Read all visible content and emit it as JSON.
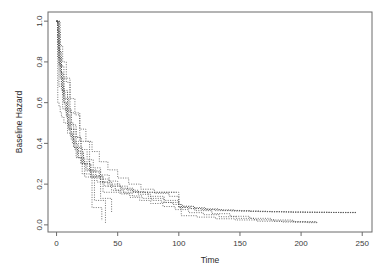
{
  "figure": {
    "background_color": "#ffffff",
    "plot_box": {
      "left_px": 48,
      "right_px": 372,
      "top_px": 12,
      "bottom_px": 232,
      "frame_color": "#6b6b6b"
    }
  },
  "chart_data": {
    "type": "line",
    "title": "",
    "subtitle": "",
    "xlabel": "Time",
    "ylabel": "Baseline Hazard",
    "xlim": [
      -7,
      258
    ],
    "ylim": [
      -0.035,
      1.045
    ],
    "xticks": [
      0,
      50,
      100,
      150,
      200,
      250
    ],
    "xticklabels": [
      "0",
      "50",
      "100",
      "150",
      "200",
      "250"
    ],
    "yticks": [
      0.0,
      0.2,
      0.4,
      0.6,
      0.8,
      1.0
    ],
    "yticklabels": [
      "0.0",
      "0.2",
      "0.4",
      "0.6",
      "0.8",
      "1.0"
    ],
    "grid": false,
    "legend": null,
    "legend_position": "none",
    "annotations": [],
    "line_style": "dotted",
    "line_color": "#4d4d4d",
    "step_type": "post",
    "series": [
      {
        "name": "curve-1",
        "x": [
          0,
          1,
          2,
          3,
          4,
          5,
          6,
          8,
          10,
          12,
          15,
          18,
          21,
          25,
          30,
          36,
          42,
          48,
          55,
          62,
          70,
          78,
          86,
          95,
          103,
          112,
          122,
          133,
          145,
          158,
          172,
          188,
          205,
          222,
          245
        ],
        "y": [
          1.0,
          0.93,
          0.86,
          0.79,
          0.72,
          0.66,
          0.6,
          0.53,
          0.47,
          0.42,
          0.37,
          0.33,
          0.3,
          0.27,
          0.24,
          0.21,
          0.19,
          0.17,
          0.155,
          0.142,
          0.13,
          0.12,
          0.11,
          0.1,
          0.092,
          0.085,
          0.079,
          0.074,
          0.07,
          0.067,
          0.065,
          0.063,
          0.062,
          0.061,
          0.06
        ]
      },
      {
        "name": "curve-2",
        "x": [
          0,
          1,
          2,
          3,
          5,
          7,
          9,
          11,
          14,
          17,
          20,
          24,
          28,
          33,
          39,
          45,
          52,
          60,
          68,
          77,
          87,
          97,
          108,
          120,
          133,
          147,
          162,
          178,
          195,
          213
        ],
        "y": [
          1.0,
          0.9,
          0.82,
          0.75,
          0.64,
          0.56,
          0.49,
          0.44,
          0.38,
          0.33,
          0.3,
          0.265,
          0.235,
          0.21,
          0.19,
          0.17,
          0.152,
          0.135,
          0.12,
          0.105,
          0.09,
          0.075,
          0.06,
          0.05,
          0.04,
          0.032,
          0.025,
          0.018,
          0.014,
          0.01
        ]
      },
      {
        "name": "curve-3",
        "x": [
          0,
          1,
          2,
          4,
          6,
          8,
          11,
          14,
          18,
          22,
          27,
          32,
          38,
          45,
          53,
          62,
          72,
          83,
          95,
          100,
          108,
          118,
          130,
          143,
          158,
          175,
          193,
          212,
          232,
          245
        ],
        "y": [
          1.0,
          0.88,
          0.79,
          0.68,
          0.6,
          0.54,
          0.47,
          0.41,
          0.36,
          0.31,
          0.27,
          0.24,
          0.21,
          0.19,
          0.175,
          0.163,
          0.16,
          0.16,
          0.16,
          0.085,
          0.08,
          0.075,
          0.07,
          0.068,
          0.066,
          0.064,
          0.062,
          0.061,
          0.06,
          0.06
        ]
      },
      {
        "name": "curve-4",
        "x": [
          0,
          2,
          4,
          6,
          9,
          12,
          16,
          20,
          25,
          30,
          36,
          43,
          50,
          58,
          67,
          77,
          88,
          100,
          113,
          127,
          142,
          158,
          175,
          193,
          212
        ],
        "y": [
          1.0,
          0.85,
          0.74,
          0.65,
          0.56,
          0.49,
          0.43,
          0.37,
          0.32,
          0.28,
          0.245,
          0.215,
          0.19,
          0.17,
          0.15,
          0.13,
          0.11,
          0.09,
          0.07,
          0.055,
          0.042,
          0.032,
          0.024,
          0.016,
          0.01
        ]
      },
      {
        "name": "curve-5-step",
        "x": [
          0,
          3,
          7,
          11,
          11,
          19,
          19,
          27,
          27,
          36,
          36,
          45,
          45
        ],
        "y": [
          1.0,
          0.72,
          0.72,
          0.72,
          0.55,
          0.55,
          0.41,
          0.41,
          0.265,
          0.265,
          0.13,
          0.13,
          0.06
        ]
      },
      {
        "name": "curve-6-step",
        "x": [
          0,
          2,
          6,
          6,
          10,
          10,
          16,
          16,
          23,
          23,
          31,
          31,
          40,
          40
        ],
        "y": [
          1.0,
          0.78,
          0.78,
          0.62,
          0.62,
          0.47,
          0.47,
          0.33,
          0.33,
          0.235,
          0.235,
          0.12,
          0.12,
          0.01
        ]
      },
      {
        "name": "curve-7-step",
        "x": [
          0,
          1,
          4,
          4,
          9,
          9,
          14,
          14,
          21,
          21,
          29,
          29,
          37,
          37
        ],
        "y": [
          1.0,
          0.82,
          0.82,
          0.66,
          0.66,
          0.5,
          0.5,
          0.38,
          0.38,
          0.25,
          0.25,
          0.085,
          0.085,
          0.02
        ]
      },
      {
        "name": "curve-8-step",
        "x": [
          0,
          2,
          5,
          5,
          12,
          12,
          20,
          20,
          28,
          28,
          38,
          38,
          47,
          47,
          60,
          72,
          85,
          98
        ],
        "y": [
          1.0,
          0.68,
          0.68,
          0.57,
          0.57,
          0.43,
          0.43,
          0.3,
          0.3,
          0.235,
          0.235,
          0.16,
          0.16,
          0.16,
          0.16,
          0.16,
          0.16,
          0.16
        ]
      },
      {
        "name": "curve-9",
        "x": [
          0,
          1,
          3,
          5,
          8,
          11,
          15,
          19,
          24,
          29,
          35,
          42,
          50,
          59,
          69,
          80,
          92,
          100,
          110,
          122,
          135,
          150,
          166,
          184,
          203,
          224,
          245
        ],
        "y": [
          1.0,
          0.95,
          0.88,
          0.8,
          0.7,
          0.62,
          0.54,
          0.47,
          0.41,
          0.36,
          0.31,
          0.27,
          0.23,
          0.2,
          0.175,
          0.155,
          0.14,
          0.085,
          0.08,
          0.075,
          0.071,
          0.068,
          0.065,
          0.063,
          0.062,
          0.061,
          0.06
        ]
      },
      {
        "name": "curve-10",
        "x": [
          0,
          1,
          2,
          3,
          4,
          6,
          9,
          13,
          17,
          22,
          28,
          35,
          43,
          52,
          63,
          75,
          88,
          100,
          102,
          115,
          130,
          146,
          164,
          184,
          205,
          213
        ],
        "y": [
          1.0,
          0.6,
          0.58,
          0.55,
          0.53,
          0.5,
          0.45,
          0.4,
          0.35,
          0.3,
          0.26,
          0.225,
          0.2,
          0.18,
          0.16,
          0.14,
          0.12,
          0.1,
          0.045,
          0.038,
          0.03,
          0.024,
          0.018,
          0.014,
          0.011,
          0.01
        ]
      }
    ]
  }
}
